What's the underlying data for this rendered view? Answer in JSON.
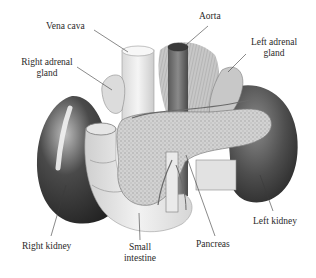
{
  "figure": {
    "colors": {
      "background": "#ffffff",
      "label_text": "#2a2a2a",
      "leader_line": "#3a3a3a",
      "kidney_dark": "#3c3c3c",
      "organ_light": "#e6e6e6",
      "pancreas": "#cfcfcf"
    }
  },
  "labels": {
    "vena_cava": "Vena cava",
    "aorta": "Aorta",
    "right_adrenal_line1": "Right adrenal",
    "right_adrenal_line2": "gland",
    "left_adrenal_line1": "Left adrenal",
    "left_adrenal_line2": "gland",
    "right_kidney": "Right kidney",
    "small_intestine_line1": "Small",
    "small_intestine_line2": "intestine",
    "pancreas": "Pancreas",
    "left_kidney": "Left kidney"
  }
}
